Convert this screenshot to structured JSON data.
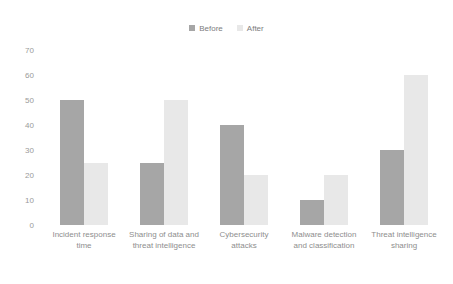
{
  "chart_data": {
    "type": "bar",
    "title": "",
    "subtitle": "",
    "xlabel": "",
    "ylabel": "",
    "ylim": [
      0,
      70
    ],
    "yticks": [
      0,
      10,
      20,
      30,
      40,
      50,
      60,
      70
    ],
    "grid": false,
    "legend_position": "top-center",
    "categories": [
      "Incident response time",
      "Sharing of data and threat intelligence",
      "Cybersecurity attacks",
      "Malware detection and classification",
      "Threat intelligence sharing"
    ],
    "series": [
      {
        "name": "Before",
        "color": "#a6a6a6",
        "values": [
          50,
          25,
          40,
          10,
          30
        ]
      },
      {
        "name": "After",
        "color": "#e8e8e8",
        "values": [
          25,
          50,
          20,
          20,
          60
        ]
      }
    ]
  },
  "legend": {
    "items": [
      {
        "label": "Before",
        "color": "#a6a6a6"
      },
      {
        "label": "After",
        "color": "#e8e8e8"
      }
    ]
  },
  "axis": {
    "y_tick_labels": [
      "70",
      "60",
      "50",
      "40",
      "30",
      "20",
      "10",
      "0"
    ],
    "x_tick_labels": [
      "Incident response time",
      "Sharing of data and threat intelligence",
      "Cybersecurity attacks",
      "Malware detection and classification",
      "Threat intelligence sharing"
    ]
  },
  "colors": {
    "background": "#ffffff",
    "before_bar": "#a6a6a6",
    "after_bar": "#e8e8e8",
    "tick_text": "#9a9a9a",
    "label_text": "#8e8e8e",
    "legend_text": "#7d7d7d"
  }
}
